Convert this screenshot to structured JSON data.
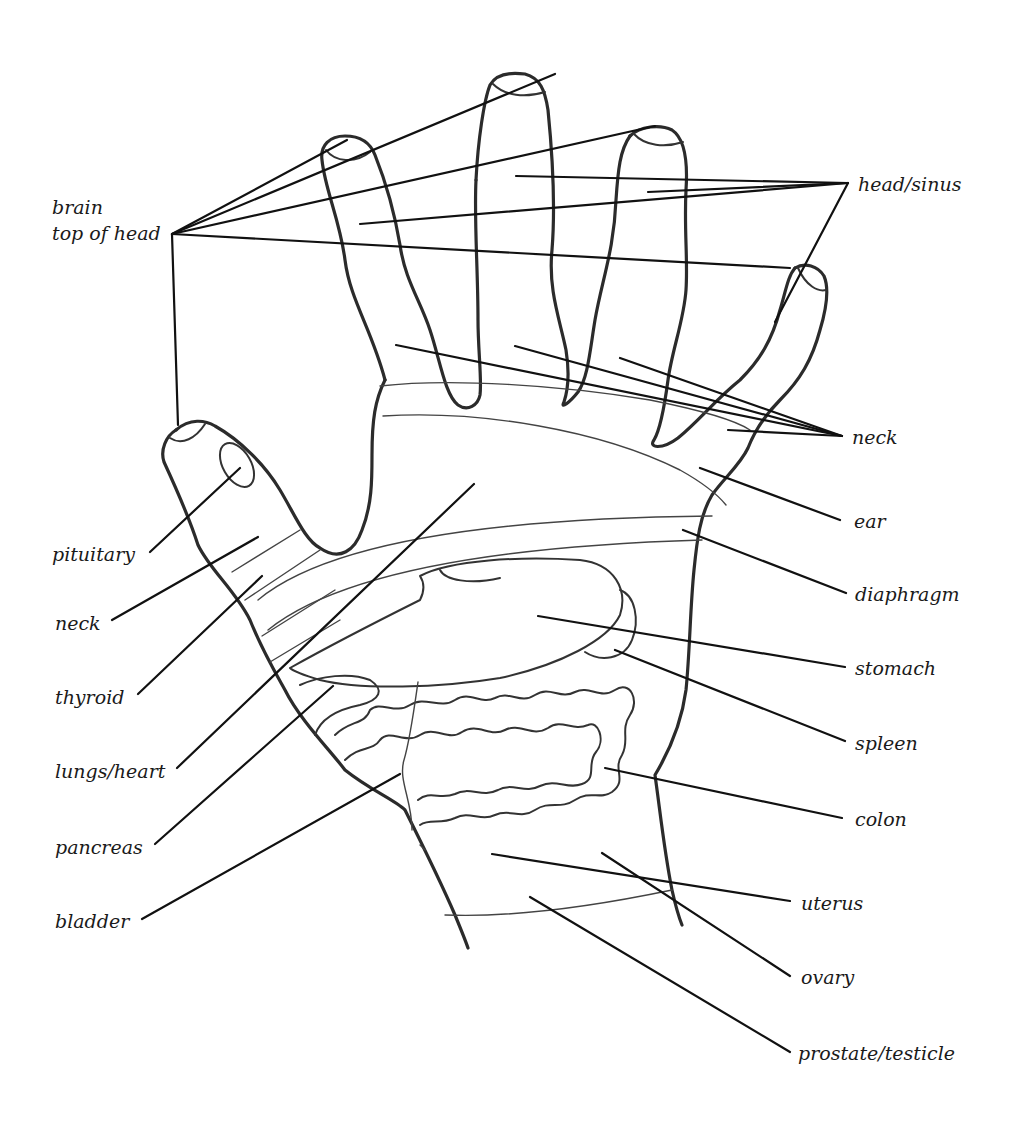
{
  "diagram": {
    "labels": {
      "brain": "brain",
      "top_of_head": "top of head",
      "head_sinus": "head/sinus",
      "neck_right": "neck",
      "ear": "ear",
      "diaphragm": "diaphragm",
      "stomach": "stomach",
      "spleen": "spleen",
      "colon": "colon",
      "uterus": "uterus",
      "ovary": "ovary",
      "prostate_testicle": "prostate/testicle",
      "pituitary": "pituitary",
      "neck_left": "neck",
      "thyroid": "thyroid",
      "lungs_heart": "lungs/heart",
      "pancreas": "pancreas",
      "bladder": "bladder"
    },
    "colors": {
      "outline": "#2b2b2b",
      "leader": "#111111",
      "background": "#ffffff"
    }
  }
}
